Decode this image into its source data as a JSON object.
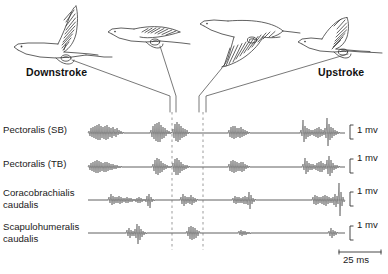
{
  "figure": {
    "background_color": "#ffffff",
    "trace_color": "#707070",
    "bird_outline_color": "#3a3a3a",
    "leader_color": "#555555",
    "dashed_line_color": "#888888",
    "text_color": "#1a1a1a"
  },
  "phase_labels": {
    "downstroke": "Downstroke",
    "upstroke": "Upstroke"
  },
  "birds": [
    {
      "name": "bird-wing-up-downstroke-start",
      "phase": "Downstroke",
      "wing_position": "wings raised high"
    },
    {
      "name": "bird-wing-mid-downstroke",
      "phase": "Downstroke",
      "wing_position": "wings mid, extended back"
    },
    {
      "name": "bird-wing-down-upstroke-start",
      "phase": "Upstroke",
      "wing_position": "wings swept down"
    },
    {
      "name": "bird-wing-mid-upstroke",
      "phase": "Upstroke",
      "wing_position": "wings raised partly"
    }
  ],
  "channels": [
    {
      "id": "pectoralis-sb",
      "label": "Pectoralis (SB)",
      "amplitude_scale": "1 mv"
    },
    {
      "id": "pectoralis-tb",
      "label": "Pectoralis (TB)",
      "amplitude_scale": "1 mv"
    },
    {
      "id": "coracobrachialis-caudalis",
      "label": "Coracobrachialis\ncaudalis",
      "amplitude_scale": "1 mv"
    },
    {
      "id": "scapulohumeralis-caudalis",
      "label": "Scapulohumeralis\ncaudalis",
      "amplitude_scale": "1 mv"
    }
  ],
  "scale_bars": {
    "amplitude": "1 mv",
    "time": "25 ms"
  },
  "chart_data": {
    "type": "line",
    "xlabel": "",
    "ylabel": "",
    "grid": false,
    "legend_position": "none",
    "x_axis_units": "ms",
    "y_axis_units": "mv",
    "time_scale_bar_ms": 25,
    "amplitude_scale_bar_mv": 1,
    "phase_markers_x_px": [
      172,
      203
    ],
    "trace_x_start_px": 88,
    "trace_x_end_px": 345,
    "series": [
      {
        "name": "Pectoralis (SB)",
        "baseline_y_px": 133,
        "bursts": [
          {
            "start_px": 90,
            "end_px": 124,
            "peak_mv": 0.55,
            "density": "high"
          },
          {
            "start_px": 150,
            "end_px": 172,
            "peak_mv": 0.7,
            "density": "high"
          },
          {
            "start_px": 172,
            "end_px": 190,
            "peak_mv": 0.6,
            "density": "high"
          },
          {
            "start_px": 228,
            "end_px": 252,
            "peak_mv": 0.55,
            "density": "high"
          },
          {
            "start_px": 300,
            "end_px": 342,
            "peak_mv": 0.95,
            "density": "high"
          }
        ]
      },
      {
        "name": "Pectoralis (TB)",
        "baseline_y_px": 167,
        "bursts": [
          {
            "start_px": 90,
            "end_px": 124,
            "peak_mv": 0.45,
            "density": "high"
          },
          {
            "start_px": 152,
            "end_px": 172,
            "peak_mv": 0.65,
            "density": "high"
          },
          {
            "start_px": 172,
            "end_px": 190,
            "peak_mv": 0.5,
            "density": "high"
          },
          {
            "start_px": 228,
            "end_px": 252,
            "peak_mv": 0.5,
            "density": "high"
          },
          {
            "start_px": 302,
            "end_px": 340,
            "peak_mv": 0.75,
            "density": "high"
          }
        ]
      },
      {
        "name": "Coracobrachialis caudalis",
        "baseline_y_px": 200,
        "bursts": [
          {
            "start_px": 108,
            "end_px": 152,
            "peak_mv": 0.5,
            "density": "medium"
          },
          {
            "start_px": 180,
            "end_px": 198,
            "peak_mv": 0.35,
            "density": "medium"
          },
          {
            "start_px": 232,
            "end_px": 256,
            "peak_mv": 0.55,
            "density": "medium"
          },
          {
            "start_px": 312,
            "end_px": 346,
            "peak_mv": 1.0,
            "density": "medium"
          }
        ]
      },
      {
        "name": "Scapulohumeralis caudalis",
        "baseline_y_px": 233,
        "bursts": [
          {
            "start_px": 126,
            "end_px": 148,
            "peak_mv": 0.7,
            "density": "low"
          },
          {
            "start_px": 186,
            "end_px": 200,
            "peak_mv": 0.45,
            "density": "low"
          },
          {
            "start_px": 238,
            "end_px": 252,
            "peak_mv": 0.25,
            "density": "low"
          },
          {
            "start_px": 328,
            "end_px": 338,
            "peak_mv": 0.3,
            "density": "low"
          }
        ]
      }
    ]
  }
}
